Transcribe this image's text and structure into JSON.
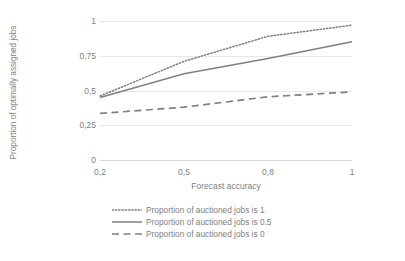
{
  "chart_data": {
    "type": "line",
    "title": "",
    "xlabel": "Forecast accuracy",
    "ylabel": "Proportion of optimally assigned jobs",
    "categories": [
      "0,2",
      "0,5",
      "0,8",
      "1"
    ],
    "x": [
      0.2,
      0.5,
      0.8,
      1
    ],
    "x_tick_labels": [
      "0,2",
      "0,5",
      "0,8",
      "1"
    ],
    "y_tick_labels": [
      "1",
      "0,75",
      "0,5",
      "0,25",
      "0"
    ],
    "y_ticks": [
      1,
      0.75,
      0.5,
      0.25,
      0
    ],
    "ylim": [
      0,
      1
    ],
    "grid": "horizontal",
    "legend_position": "bottom",
    "series": [
      {
        "name": "Proportion of auctioned jobs is 1",
        "style": "dotted",
        "color": "#808080",
        "values": [
          0.46,
          0.71,
          0.89,
          0.97
        ]
      },
      {
        "name": "Proportion of auctioned jobs is 0.5",
        "style": "solid",
        "color": "#808080",
        "values": [
          0.45,
          0.62,
          0.73,
          0.85
        ]
      },
      {
        "name": "Proportion of auctioned jobs is 0",
        "style": "dashed",
        "color": "#808080",
        "values": [
          0.335,
          0.38,
          0.455,
          0.49
        ]
      }
    ]
  },
  "legend": {
    "items": [
      {
        "label": "Proportion of auctioned jobs is 1"
      },
      {
        "label": "Proportion of auctioned jobs is 0.5"
      },
      {
        "label": "Proportion of auctioned jobs is 0"
      }
    ]
  },
  "axes": {
    "y_title": "Proportion of optimally assigned jobs",
    "x_title": "Forecast accuracy"
  }
}
